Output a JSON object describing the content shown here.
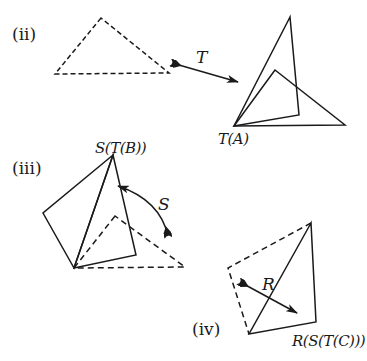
{
  "figure": {
    "panels": [
      {
        "id": "ii",
        "label": "(ii)",
        "transform": {
          "name": "T",
          "type": "translation"
        },
        "source_triangle": {
          "style": "dashed",
          "points": [
            [
              101,
              18
            ],
            [
              55,
              74
            ],
            [
              169,
              73
            ]
          ]
        },
        "image_label": "T(A)",
        "image_shapes": [
          {
            "style": "solid",
            "points": [
              [
                290,
                17
              ],
              [
                234,
                126
              ],
              [
                299,
                115
              ]
            ]
          },
          {
            "style": "solid",
            "points": [
              [
                275,
                70
              ],
              [
                234,
                126
              ],
              [
                345,
                125
              ]
            ]
          }
        ],
        "arrow": {
          "from": [
            172,
            63
          ],
          "to": [
            238,
            82
          ]
        }
      },
      {
        "id": "iii",
        "label": "(iii)",
        "transform": {
          "name": "S",
          "type": "rotation"
        },
        "image_label": "S(T(B))",
        "solid_shapes": [
          {
            "style": "solid",
            "points": [
              [
                113,
                155
              ],
              [
                43,
                213
              ],
              [
                74,
                268
              ]
            ]
          },
          {
            "style": "solid",
            "points": [
              [
                113,
                155
              ],
              [
                74,
                268
              ],
              [
                136,
                255
              ]
            ]
          }
        ],
        "dashed_shapes": [
          {
            "style": "dashed",
            "points": [
              [
                115,
                216
              ],
              [
                74,
                268
              ],
              [
                185,
                267
              ]
            ]
          }
        ],
        "arc_arrow": {
          "from": [
            168,
            236
          ],
          "to": [
            118,
            186
          ],
          "control": [
            160,
            200
          ]
        }
      },
      {
        "id": "iv",
        "label": "(iv)",
        "transform": {
          "name": "R",
          "type": "reflection"
        },
        "image_label": "R(S(T(C)))",
        "solid_shapes": [
          {
            "style": "solid",
            "points": [
              [
                311,
                223
              ],
              [
                249,
                334
              ],
              [
                316,
                322
              ]
            ]
          }
        ],
        "dashed_shapes": [
          {
            "style": "dashed",
            "points": [
              [
                311,
                223
              ],
              [
                228,
                268
              ],
              [
                249,
                334
              ]
            ]
          }
        ],
        "arrow": {
          "from": [
            240,
            282
          ],
          "to": [
            297,
            313
          ]
        }
      }
    ],
    "colors": {
      "stroke": "#1a1a1a",
      "background": "#ffffff"
    }
  }
}
